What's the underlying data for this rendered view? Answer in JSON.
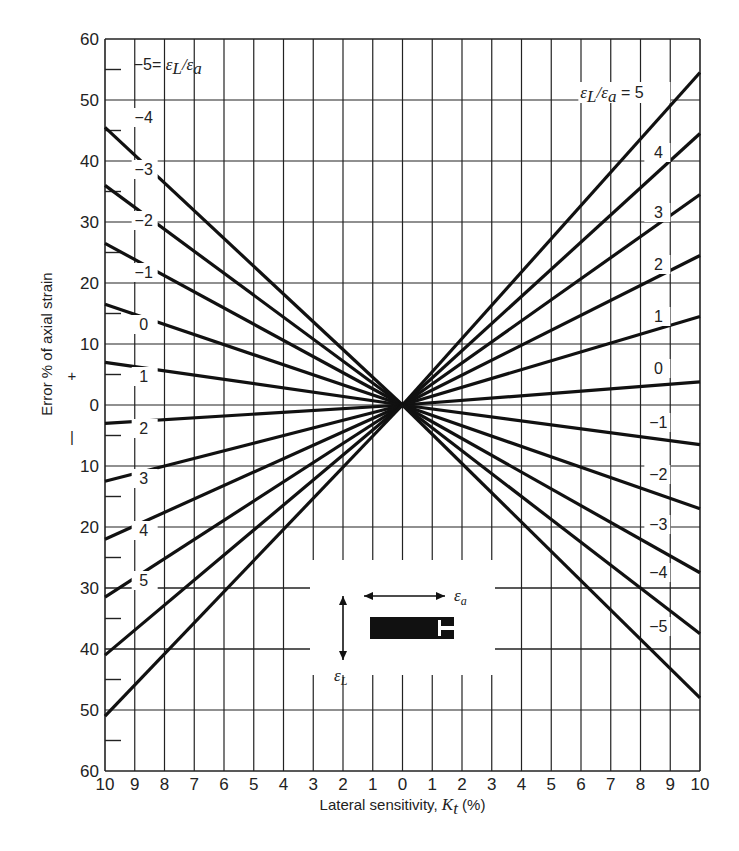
{
  "chart_data": {
    "type": "line",
    "title": "",
    "xlabel": "Lateral sensitivity, K_t (%)",
    "xlabel_parts": {
      "prefix": "Lateral sensitivity, ",
      "symbol": "K",
      "subscript": "t",
      "suffix": " (%)"
    },
    "ylabel": "Error % of axial strain",
    "ylabel_sign_plus": "+",
    "ylabel_sign_minus": "–",
    "x_ticks": [
      "10",
      "9",
      "8",
      "7",
      "6",
      "5",
      "4",
      "3",
      "2",
      "1",
      "0",
      "1",
      "2",
      "3",
      "4",
      "5",
      "6",
      "7",
      "8",
      "9",
      "10"
    ],
    "x_tick_values": [
      -10,
      -9,
      -8,
      -7,
      -6,
      -5,
      -4,
      -3,
      -2,
      -1,
      0,
      1,
      2,
      3,
      4,
      5,
      6,
      7,
      8,
      9,
      10
    ],
    "y_ticks": [
      "60",
      "50",
      "40",
      "30",
      "20",
      "10",
      "0",
      "10",
      "20",
      "30",
      "40",
      "50",
      "60"
    ],
    "y_tick_values": [
      60,
      50,
      40,
      30,
      20,
      10,
      0,
      -10,
      -20,
      -30,
      -40,
      -50,
      -60
    ],
    "xlim": [
      -10,
      10
    ],
    "ylim": [
      -60,
      60
    ],
    "grid": true,
    "minor_y_ticks_every": 5,
    "origin": {
      "x": 0,
      "y": 0
    },
    "series_right": [
      {
        "name": "εL/εa = 5",
        "ratio": 5,
        "x": [
          0,
          10
        ],
        "y": [
          0,
          54.5
        ],
        "label": "εL/εa = 5"
      },
      {
        "name": "4",
        "ratio": 4,
        "x": [
          0,
          10
        ],
        "y": [
          0,
          44.5
        ],
        "label": "4"
      },
      {
        "name": "3",
        "ratio": 3,
        "x": [
          0,
          10
        ],
        "y": [
          0,
          34.5
        ],
        "label": "3"
      },
      {
        "name": "2",
        "ratio": 2,
        "x": [
          0,
          10
        ],
        "y": [
          0,
          24.5
        ],
        "label": "2"
      },
      {
        "name": "1",
        "ratio": 1,
        "x": [
          0,
          10
        ],
        "y": [
          0,
          14.5
        ],
        "label": "1"
      },
      {
        "name": "0",
        "ratio": 0,
        "x": [
          0,
          10
        ],
        "y": [
          0,
          3.8
        ],
        "label": "0"
      },
      {
        "name": "-1",
        "ratio": -1,
        "x": [
          0,
          10
        ],
        "y": [
          0,
          -6.5
        ],
        "label": "−1"
      },
      {
        "name": "-2",
        "ratio": -2,
        "x": [
          0,
          10
        ],
        "y": [
          0,
          -17
        ],
        "label": "−2"
      },
      {
        "name": "-3",
        "ratio": -3,
        "x": [
          0,
          10
        ],
        "y": [
          0,
          -27.5
        ],
        "label": "−3"
      },
      {
        "name": "-4",
        "ratio": -4,
        "x": [
          0,
          10
        ],
        "y": [
          0,
          -37.5
        ],
        "label": "−4"
      },
      {
        "name": "-5",
        "ratio": -5,
        "x": [
          0,
          10
        ],
        "y": [
          0,
          -48
        ],
        "label": "−5"
      }
    ],
    "series_left": [
      {
        "name": "-5 = εL/εa",
        "ratio": -5,
        "x": [
          -10,
          0
        ],
        "y": [
          45.5,
          0
        ],
        "label": "−5 = εL/εa"
      },
      {
        "name": "-4",
        "ratio": -4,
        "x": [
          -10,
          0
        ],
        "y": [
          36,
          0
        ],
        "label": "−4"
      },
      {
        "name": "-3",
        "ratio": -3,
        "x": [
          -10,
          0
        ],
        "y": [
          26.5,
          0
        ],
        "label": "−3"
      },
      {
        "name": "-2",
        "ratio": -2,
        "x": [
          -10,
          0
        ],
        "y": [
          16.5,
          0
        ],
        "label": "−2"
      },
      {
        "name": "-1",
        "ratio": -1,
        "x": [
          -10,
          0
        ],
        "y": [
          7,
          0
        ],
        "label": "−1"
      },
      {
        "name": "0",
        "ratio": 0,
        "x": [
          -10,
          0
        ],
        "y": [
          -3,
          0
        ],
        "label": "0"
      },
      {
        "name": "1",
        "ratio": 1,
        "x": [
          -10,
          0
        ],
        "y": [
          -12.5,
          0
        ],
        "label": "1"
      },
      {
        "name": "2",
        "ratio": 2,
        "x": [
          -10,
          0
        ],
        "y": [
          -22,
          0
        ],
        "label": "2"
      },
      {
        "name": "3",
        "ratio": 3,
        "x": [
          -10,
          0
        ],
        "y": [
          -31.5,
          0
        ],
        "label": "3"
      },
      {
        "name": "4",
        "ratio": 4,
        "x": [
          -10,
          0
        ],
        "y": [
          -41,
          0
        ],
        "label": "4"
      },
      {
        "name": "5",
        "ratio": 5,
        "x": [
          -10,
          0
        ],
        "y": [
          -51,
          0
        ],
        "label": "5"
      }
    ],
    "inset": {
      "description": "strain gauge sketch with axial and lateral strain arrows",
      "axial_label": "εa",
      "lateral_label": "εL"
    },
    "annotations": {
      "right_title_prefix": "ε",
      "ratio_symbol_L": "L",
      "ratio_symbol_a": "a"
    }
  }
}
